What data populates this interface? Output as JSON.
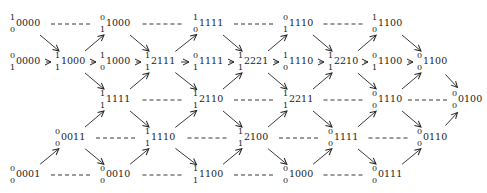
{
  "diagram": {
    "title": "",
    "nodes": [
      {
        "id": "n0",
        "col": 0,
        "row": 0,
        "top": "1",
        "bot": "0",
        "main": "0000"
      },
      {
        "id": "n1",
        "col": 0,
        "row": 1,
        "top": "0",
        "bot": "1",
        "main": "0000"
      },
      {
        "id": "n2",
        "col": 0,
        "row": 4,
        "top": "0",
        "bot": "0",
        "main": "0001"
      },
      {
        "id": "n3",
        "col": 1,
        "row": 1,
        "top": "1",
        "bot": "1",
        "main": "1000"
      },
      {
        "id": "n4",
        "col": 1,
        "row": 3,
        "top": "0",
        "bot": "0",
        "main": "0011"
      },
      {
        "id": "n5",
        "col": 2,
        "row": 0,
        "top": "0",
        "bot": "1",
        "main": "1000"
      },
      {
        "id": "n6",
        "col": 2,
        "row": 1,
        "top": "1",
        "bot": "0",
        "main": "1000"
      },
      {
        "id": "n7",
        "col": 2,
        "row": 2,
        "top": "1",
        "bot": "1",
        "main": "1111"
      },
      {
        "id": "n8",
        "col": 2,
        "row": 4,
        "top": "0",
        "bot": "0",
        "main": "0010"
      },
      {
        "id": "n9",
        "col": 3,
        "row": 1,
        "top": "1",
        "bot": "1",
        "main": "2111"
      },
      {
        "id": "n10",
        "col": 3,
        "row": 3,
        "top": "1",
        "bot": "1",
        "main": "1110"
      },
      {
        "id": "n11",
        "col": 4,
        "row": 0,
        "top": "1",
        "bot": "0",
        "main": "1111"
      },
      {
        "id": "n12",
        "col": 4,
        "row": 1,
        "top": "0",
        "bot": "1",
        "main": "1111"
      },
      {
        "id": "n13",
        "col": 4,
        "row": 2,
        "top": "1",
        "bot": "1",
        "main": "2110"
      },
      {
        "id": "n14",
        "col": 4,
        "row": 4,
        "top": "1",
        "bot": "1",
        "main": "1100"
      },
      {
        "id": "n15",
        "col": 5,
        "row": 1,
        "top": "1",
        "bot": "1",
        "main": "2221"
      },
      {
        "id": "n16",
        "col": 5,
        "row": 3,
        "top": "1",
        "bot": "1",
        "main": "2100"
      },
      {
        "id": "n17",
        "col": 6,
        "row": 0,
        "top": "0",
        "bot": "1",
        "main": "1110"
      },
      {
        "id": "n18",
        "col": 6,
        "row": 1,
        "top": "1",
        "bot": "0",
        "main": "1110"
      },
      {
        "id": "n19",
        "col": 6,
        "row": 2,
        "top": "1",
        "bot": "1",
        "main": "2211"
      },
      {
        "id": "n20",
        "col": 6,
        "row": 4,
        "top": "0",
        "bot": "0",
        "main": "1000"
      },
      {
        "id": "n21",
        "col": 7,
        "row": 1,
        "top": "1",
        "bot": "1",
        "main": "2210"
      },
      {
        "id": "n22",
        "col": 7,
        "row": 3,
        "top": "0",
        "bot": "0",
        "main": "1111"
      },
      {
        "id": "n23",
        "col": 8,
        "row": 0,
        "top": "1",
        "bot": "0",
        "main": "1100"
      },
      {
        "id": "n24",
        "col": 8,
        "row": 1,
        "top": "0",
        "bot": "1",
        "main": "1100"
      },
      {
        "id": "n25",
        "col": 8,
        "row": 2,
        "top": "0",
        "bot": "0",
        "main": "1110"
      },
      {
        "id": "n26",
        "col": 8,
        "row": 4,
        "top": "0",
        "bot": "0",
        "main": "0111"
      },
      {
        "id": "n27",
        "col": 9,
        "row": 1,
        "top": "0",
        "bot": "0",
        "main": "1100"
      },
      {
        "id": "n28",
        "col": 9,
        "row": 3,
        "top": "0",
        "bot": "0",
        "main": "0110"
      },
      {
        "id": "n29",
        "col": 10,
        "row": 2,
        "top": "0",
        "bot": "0",
        "main": "0100"
      }
    ],
    "arrows": [
      [
        "n0",
        "n3"
      ],
      [
        "n1",
        "n3"
      ],
      [
        "n2",
        "n4"
      ],
      [
        "n3",
        "n5"
      ],
      [
        "n3",
        "n6"
      ],
      [
        "n3",
        "n7"
      ],
      [
        "n4",
        "n7"
      ],
      [
        "n4",
        "n8"
      ],
      [
        "n5",
        "n9"
      ],
      [
        "n6",
        "n9"
      ],
      [
        "n7",
        "n9"
      ],
      [
        "n7",
        "n10"
      ],
      [
        "n8",
        "n10"
      ],
      [
        "n9",
        "n11"
      ],
      [
        "n9",
        "n12"
      ],
      [
        "n9",
        "n13"
      ],
      [
        "n10",
        "n13"
      ],
      [
        "n10",
        "n14"
      ],
      [
        "n11",
        "n15"
      ],
      [
        "n12",
        "n15"
      ],
      [
        "n13",
        "n15"
      ],
      [
        "n13",
        "n16"
      ],
      [
        "n14",
        "n16"
      ],
      [
        "n15",
        "n17"
      ],
      [
        "n15",
        "n18"
      ],
      [
        "n15",
        "n19"
      ],
      [
        "n16",
        "n19"
      ],
      [
        "n16",
        "n20"
      ],
      [
        "n17",
        "n21"
      ],
      [
        "n18",
        "n21"
      ],
      [
        "n19",
        "n21"
      ],
      [
        "n19",
        "n22"
      ],
      [
        "n20",
        "n22"
      ],
      [
        "n21",
        "n23"
      ],
      [
        "n21",
        "n24"
      ],
      [
        "n21",
        "n25"
      ],
      [
        "n22",
        "n25"
      ],
      [
        "n22",
        "n26"
      ],
      [
        "n23",
        "n27"
      ],
      [
        "n24",
        "n27"
      ],
      [
        "n25",
        "n27"
      ],
      [
        "n25",
        "n28"
      ],
      [
        "n26",
        "n28"
      ],
      [
        "n27",
        "n29"
      ],
      [
        "n28",
        "n29"
      ]
    ],
    "dashed": [
      [
        "n0",
        "n5"
      ],
      [
        "n5",
        "n11"
      ],
      [
        "n11",
        "n17"
      ],
      [
        "n17",
        "n23"
      ],
      [
        "n7",
        "n13"
      ],
      [
        "n13",
        "n19"
      ],
      [
        "n19",
        "n25"
      ],
      [
        "n25",
        "n29"
      ],
      [
        "n4",
        "n10"
      ],
      [
        "n10",
        "n16"
      ],
      [
        "n16",
        "n22"
      ],
      [
        "n22",
        "n28"
      ],
      [
        "n2",
        "n8"
      ],
      [
        "n8",
        "n14"
      ],
      [
        "n14",
        "n20"
      ],
      [
        "n20",
        "n26"
      ]
    ],
    "layout": {
      "col_x": [
        10,
        55,
        100,
        145,
        193,
        238,
        283,
        328,
        372,
        417,
        452
      ],
      "row_y": [
        24,
        62,
        100,
        138,
        175
      ]
    },
    "colors": {
      "ink": "#222222",
      "background": "#ffffff"
    }
  }
}
